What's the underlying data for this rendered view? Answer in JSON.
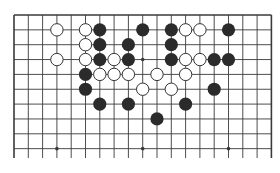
{
  "diagram": {
    "type": "go-board-fragment",
    "columns": 19,
    "rows_visible": 10,
    "grid": {
      "x0": 14,
      "dx": 14.3,
      "y0": 15,
      "dy": 14.85,
      "line_bottom": 158
    },
    "colors": {
      "line": "#3a3a3a",
      "black_stone": "#2b2b2b",
      "white_stone_fill": "#ffffff",
      "white_stone_stroke": "#333333",
      "background": "#ffffff"
    },
    "star_points": [
      [
        3,
        3
      ],
      [
        9,
        3
      ],
      [
        15,
        3
      ],
      [
        3,
        9
      ],
      [
        9,
        9
      ],
      [
        15,
        9
      ]
    ],
    "black_stones": [
      [
        6,
        1
      ],
      [
        9,
        1
      ],
      [
        11,
        1
      ],
      [
        15,
        1
      ],
      [
        6,
        2
      ],
      [
        8,
        2
      ],
      [
        11,
        2
      ],
      [
        6,
        3
      ],
      [
        8,
        3
      ],
      [
        11,
        3
      ],
      [
        14,
        3
      ],
      [
        15,
        3
      ],
      [
        5,
        4
      ],
      [
        5,
        5
      ],
      [
        14,
        5
      ],
      [
        6,
        6
      ],
      [
        8,
        6
      ],
      [
        12,
        6
      ],
      [
        10,
        7
      ]
    ],
    "white_stones": [
      [
        3,
        1
      ],
      [
        5,
        1
      ],
      [
        12,
        1
      ],
      [
        13,
        1
      ],
      [
        5,
        2
      ],
      [
        3,
        3
      ],
      [
        5,
        3
      ],
      [
        7,
        3
      ],
      [
        12,
        3
      ],
      [
        13,
        3
      ],
      [
        6,
        4
      ],
      [
        7,
        4
      ],
      [
        8,
        4
      ],
      [
        10,
        4
      ],
      [
        12,
        4
      ],
      [
        9,
        5
      ],
      [
        11,
        5
      ]
    ]
  }
}
